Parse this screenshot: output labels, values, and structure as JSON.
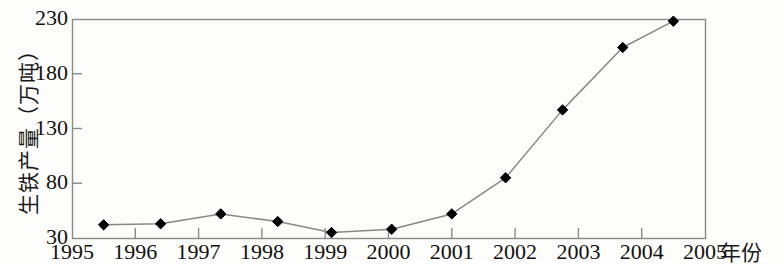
{
  "chart_data": {
    "type": "line",
    "title": "",
    "subtitle": "",
    "xlabel": "年份",
    "ylabel": "生铁产量（万吨）",
    "xlim": [
      1995,
      2005
    ],
    "ylim": [
      30,
      230
    ],
    "x_ticks": [
      1995,
      1996,
      1997,
      1998,
      1999,
      2000,
      2001,
      2002,
      2003,
      2004,
      2005
    ],
    "x_tick_labels": [
      "1995",
      "1996",
      "1997",
      "1998",
      "1999",
      "2000",
      "2001",
      "2002",
      "2003",
      "2004",
      "2005"
    ],
    "y_ticks": [
      30,
      80,
      130,
      180,
      230
    ],
    "y_tick_labels": [
      "30",
      "80",
      "130",
      "180",
      "230"
    ],
    "grid": false,
    "legend": null,
    "marker": "diamond",
    "marker_color": "#000000",
    "line_color": "#888888",
    "frame_color": "#8a8a8a",
    "series": [
      {
        "name": "生铁产量",
        "x": [
          1995.5,
          1996.4,
          1997.35,
          1998.25,
          1999.1,
          2000.05,
          2001.0,
          2001.85,
          2002.75,
          2003.7,
          2004.5
        ],
        "values": [
          42,
          43,
          52,
          45,
          35,
          38,
          52,
          85,
          147,
          204,
          228
        ]
      }
    ]
  },
  "axes": {
    "y_title": "生铁产量（万吨）",
    "x_title": "年份"
  }
}
